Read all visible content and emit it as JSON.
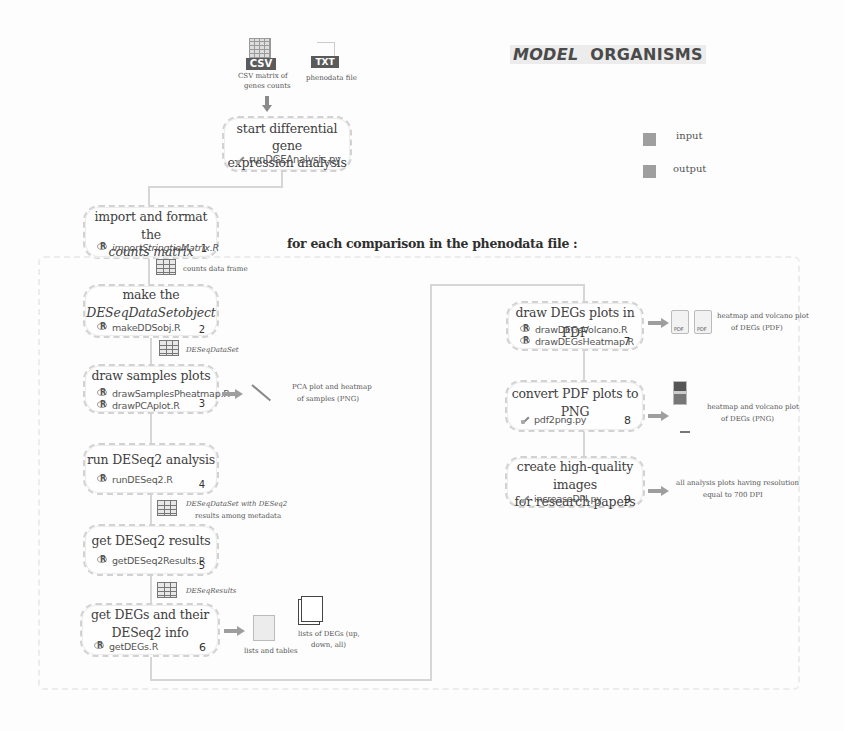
{
  "header": {
    "title_italic": "MODEL",
    "title_rest": "ORGANISMS"
  },
  "legend": {
    "items": [
      {
        "label": "input",
        "color": "#9f9f9f"
      },
      {
        "label": "output",
        "color": "#9f9f9f"
      }
    ]
  },
  "inputs": {
    "csv": {
      "badge": "CSV",
      "label_line1": "CSV matrix of",
      "label_line2": "genes counts"
    },
    "txt": {
      "badge": "TXT",
      "label": "phenodata file"
    }
  },
  "loop_label": "for each comparison in the phenodata file :",
  "steps": [
    {
      "id": 0,
      "title_lines": [
        "start differential gene",
        "expression analysis"
      ],
      "scripts": [
        {
          "name": "runDGEAnalysis.py",
          "lang": "python"
        }
      ],
      "number": ""
    },
    {
      "id": 1,
      "title_lines": [
        "import and  format the",
        "counts matrix"
      ],
      "scripts": [
        {
          "name": "importStringtieMatrix.R",
          "lang": "R"
        }
      ],
      "number": "1"
    },
    {
      "id": 2,
      "title_lines": [
        "make the",
        "DESeqDataSetobject"
      ],
      "scripts": [
        {
          "name": "makeDDSobj.R",
          "lang": "R"
        }
      ],
      "number": "2"
    },
    {
      "id": 3,
      "title_lines": [
        "draw samples plots"
      ],
      "scripts": [
        {
          "name": "drawSamplesPheatmap.R",
          "lang": "R"
        },
        {
          "name": "drawPCAplot.R",
          "lang": "R"
        }
      ],
      "number": "3"
    },
    {
      "id": 4,
      "title_lines": [
        "run DESeq2 analysis"
      ],
      "scripts": [
        {
          "name": "runDESeq2.R",
          "lang": "R"
        }
      ],
      "number": "4"
    },
    {
      "id": 5,
      "title_lines": [
        "get DESeq2 results"
      ],
      "scripts": [
        {
          "name": "getDESeq2Results.R",
          "lang": "R"
        }
      ],
      "number": "5"
    },
    {
      "id": 6,
      "title_lines": [
        "get DEGs and their",
        "DESeq2 info"
      ],
      "scripts": [
        {
          "name": "getDEGs.R",
          "lang": "R"
        }
      ],
      "number": "6"
    },
    {
      "id": 7,
      "title_lines": [
        "draw DEGs plots in PDF"
      ],
      "scripts": [
        {
          "name": "drawDEGsVolcano.R",
          "lang": "R"
        },
        {
          "name": "drawDEGsHeatmap.R",
          "lang": "R"
        }
      ],
      "number": "7"
    },
    {
      "id": 8,
      "title_lines": [
        "convert PDF plots to PNG"
      ],
      "scripts": [
        {
          "name": "pdf2png.py",
          "lang": "python"
        }
      ],
      "number": "8"
    },
    {
      "id": 9,
      "title_lines": [
        "create high-quality images",
        "for research papers"
      ],
      "scripts": [
        {
          "name": "increaseDPI.py",
          "lang": "python"
        }
      ],
      "number": "9"
    }
  ],
  "data_objects": {
    "counts_df": "counts data frame",
    "dds": "DESeqDataSet",
    "dds_results_line1": "DESeqDataSet with  DESeq2",
    "dds_results_line2": "results among metadata",
    "deseq_results": "DESeqResults"
  },
  "outputs": {
    "samples_plots_line1": "PCA plot and heatmap",
    "samples_plots_line2": "of samples (PNG)",
    "lists_tables": "lists and tables",
    "deg_lists_line1": "lists of DEGs (up,",
    "deg_lists_line2": "down, all)",
    "pdf_plots_line1": "heatmap and volcano plot",
    "pdf_plots_line2": "of DEGs (PDF)",
    "pdf_badge": "PDF",
    "png_plots_line1": "heatmap and volcano plot",
    "png_plots_line2": "of DEGs (PNG)",
    "hq_line1": "all analysis plots  having resolution",
    "hq_line2": "equal to 700 DPI"
  }
}
